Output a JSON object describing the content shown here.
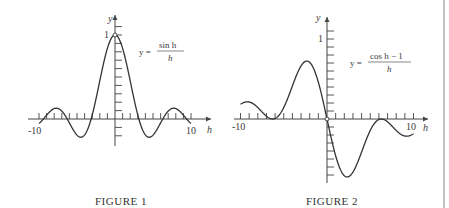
{
  "chart_data": [
    {
      "type": "line",
      "title": "FIGURE 1",
      "equation": {
        "lhs": "y =",
        "numerator": "sin h",
        "denominator": "h"
      },
      "xlabel": "h",
      "ylabel": "y",
      "xlim": [
        -10,
        10
      ],
      "ylim": [
        -0.25,
        1.2
      ],
      "x_tick_labels": [
        "-10",
        "10"
      ],
      "y_tick_labels": [
        "1"
      ],
      "x_tick_step": 1,
      "y_tick_step": 0.1,
      "function": "sin(h)/h",
      "hole_at": [
        0,
        1
      ],
      "x": [
        -10,
        -8,
        -6,
        -4.5,
        -3,
        -2,
        -1,
        0,
        1,
        2,
        3,
        4.5,
        6,
        8,
        10
      ],
      "values": [
        -0.054,
        0.124,
        -0.047,
        -0.217,
        0.047,
        0.455,
        0.841,
        1.0,
        0.841,
        0.455,
        0.047,
        -0.217,
        -0.047,
        0.124,
        -0.054
      ]
    },
    {
      "type": "line",
      "title": "FIGURE 2",
      "equation": {
        "lhs": "y =",
        "numerator": "cos h − 1",
        "denominator": "h"
      },
      "xlabel": "h",
      "ylabel": "y",
      "xlim": [
        -10,
        10
      ],
      "ylim": [
        -0.75,
        1.2
      ],
      "x_tick_labels": [
        "-10",
        "10"
      ],
      "y_tick_labels": [
        "1"
      ],
      "x_tick_step": 1,
      "y_tick_step": 0.1,
      "function": "(cos(h)-1)/h",
      "hole_at": [
        0,
        0
      ],
      "x": [
        -10,
        -8,
        -6.28,
        -4,
        -2.33,
        -1,
        0,
        1,
        2.33,
        4,
        6.28,
        8,
        10
      ],
      "values": [
        0.184,
        0.143,
        0.0,
        0.413,
        0.725,
        0.46,
        0.0,
        -0.46,
        -0.725,
        -0.413,
        0.0,
        -0.143,
        -0.184
      ]
    }
  ]
}
